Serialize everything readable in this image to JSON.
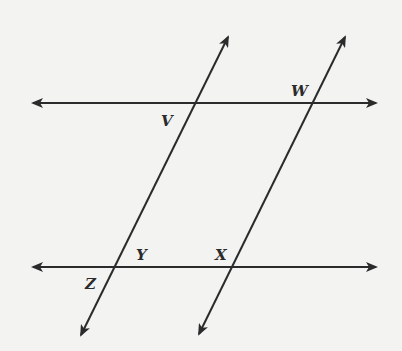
{
  "diagram": {
    "type": "two pairs of parallel lines forming a parallelogram",
    "colors": {
      "background": "#f3f3f2",
      "stroke": "#2b2b2b"
    },
    "lines": [
      {
        "id": "top-horizontal",
        "x1": 33,
        "y1": 103,
        "x2": 376,
        "y2": 103,
        "arrows": "both"
      },
      {
        "id": "bottom-horizontal",
        "x1": 33,
        "y1": 267,
        "x2": 376,
        "y2": 267,
        "arrows": "both"
      },
      {
        "id": "left-transversal",
        "x1": 228,
        "y1": 37,
        "x2": 81,
        "y2": 335,
        "arrows": "both"
      },
      {
        "id": "right-transversal",
        "x1": 345,
        "y1": 37,
        "x2": 199,
        "y2": 334,
        "arrows": "both"
      }
    ],
    "points": {
      "V": {
        "label": "V",
        "x": 161,
        "y": 126
      },
      "W": {
        "label": "W",
        "x": 291,
        "y": 96
      },
      "Y": {
        "label": "Y",
        "x": 136,
        "y": 260
      },
      "X": {
        "label": "X",
        "x": 215,
        "y": 260
      },
      "Z": {
        "label": "Z",
        "x": 85,
        "y": 289
      }
    }
  }
}
